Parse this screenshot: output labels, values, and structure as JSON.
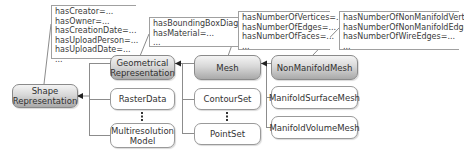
{
  "diagram": {
    "type": "class-hierarchy",
    "nodes": {
      "shape": {
        "label_line1": "Shape",
        "label_line2": "Representation",
        "highlight": true
      },
      "geometrical": {
        "label_line1": "Geometrical",
        "label_line2": "Representation",
        "highlight": true
      },
      "raster": {
        "label": "RasterData",
        "highlight": false
      },
      "multires": {
        "label_line1": "Multiresolution",
        "label_line2": "Model",
        "highlight": false
      },
      "mesh": {
        "label": "Mesh",
        "highlight": true
      },
      "contour": {
        "label": "ContourSet",
        "highlight": false
      },
      "pointset": {
        "label": "PointSet",
        "highlight": false
      },
      "nonmanifold": {
        "label": "NonManifoldMesh",
        "highlight": true
      },
      "manifoldsurface": {
        "label": "ManifoldSurfaceMesh",
        "highlight": false
      },
      "manifoldvolume": {
        "label": "ManifoldVolumeMesh",
        "highlight": false
      }
    },
    "notes": {
      "shape": [
        "hasCreator=...",
        "hasOwner=...",
        "hasCreationDate=...",
        "hasUploadPerson=...",
        "hasUploadDate=...",
        "..."
      ],
      "geometrical": [
        "hasBoundingBoxDiagonal=...",
        "hasMaterial=...",
        "..."
      ],
      "mesh": [
        "hasNumberOfVertices=...",
        "hasNumberOfEdges=...",
        "hasNumberOfFaces=...",
        "..."
      ],
      "nonmanifold": [
        "hasNumberOfNonManifoldVertices=...",
        "hasNumberOfNonManifoldEdges=...",
        "hasNumberOfWireEdges=...",
        "..."
      ]
    },
    "edges": [
      {
        "from": "geometrical",
        "to": "shape",
        "kind": "subclass"
      },
      {
        "from": "raster",
        "to": "shape",
        "kind": "subclass"
      },
      {
        "from": "multires",
        "to": "shape",
        "kind": "subclass"
      },
      {
        "from": "mesh",
        "to": "geometrical",
        "kind": "subclass"
      },
      {
        "from": "contour",
        "to": "geometrical",
        "kind": "subclass"
      },
      {
        "from": "pointset",
        "to": "geometrical",
        "kind": "subclass"
      },
      {
        "from": "nonmanifold",
        "to": "mesh",
        "kind": "subclass"
      },
      {
        "from": "manifoldsurface",
        "to": "mesh",
        "kind": "subclass"
      },
      {
        "from": "manifoldvolume",
        "to": "mesh",
        "kind": "subclass"
      }
    ],
    "colors": {
      "highlight_top": "#f4f4f4",
      "highlight_bottom": "#a9a9a9",
      "border": "#9a9a9a",
      "line": "#8c8c8c",
      "text": "#333333"
    }
  }
}
